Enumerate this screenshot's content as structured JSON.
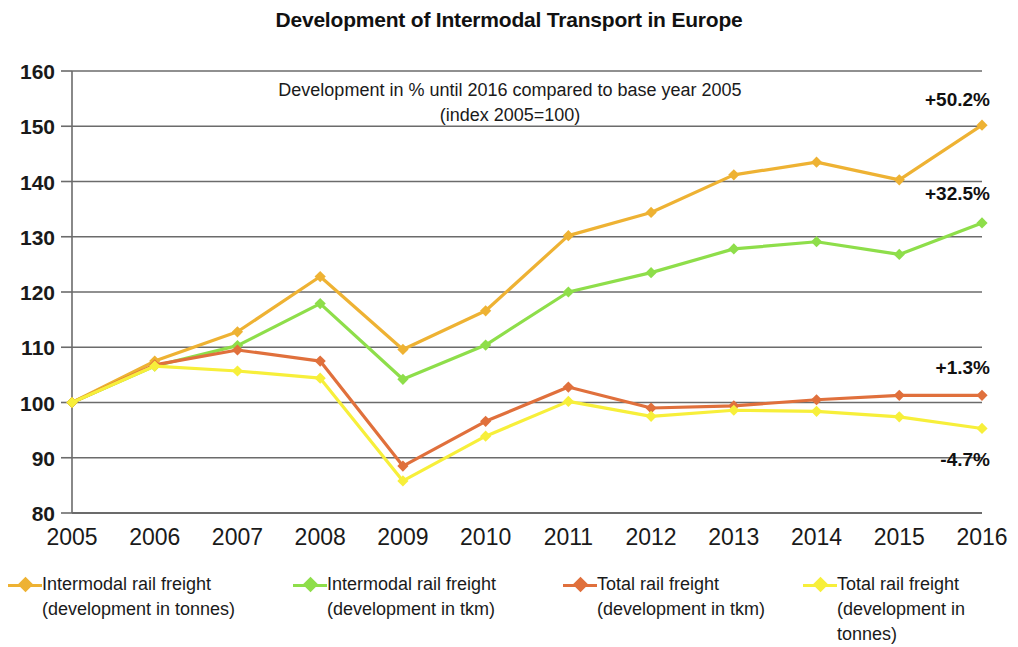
{
  "chart_data": {
    "type": "line",
    "title": "Development of Intermodal Transport in Europe",
    "subtitle_line1": "Development in % until 2016 compared  to base year 2005",
    "subtitle_line2": "(index 2005=100)",
    "xlabel": "",
    "ylabel": "",
    "x": [
      2005,
      2006,
      2007,
      2008,
      2009,
      2010,
      2011,
      2012,
      2013,
      2014,
      2015,
      2016
    ],
    "categories": [
      "2005",
      "2006",
      "2007",
      "2008",
      "2009",
      "2010",
      "2011",
      "2012",
      "2013",
      "2014",
      "2015",
      "2016"
    ],
    "ylim": [
      80,
      160
    ],
    "yticks": [
      80,
      90,
      100,
      110,
      120,
      130,
      140,
      150,
      160
    ],
    "grid": true,
    "legend_position": "bottom",
    "series": [
      {
        "name": "Intermodal rail freight\n(development in tonnes)",
        "color": "#eeb233",
        "values": [
          100.0,
          107.5,
          112.8,
          122.8,
          109.6,
          116.6,
          130.2,
          134.4,
          141.2,
          143.5,
          140.3,
          150.2
        ],
        "end_label": "+50.2%"
      },
      {
        "name": "Intermodal rail freight\n(development in tkm)",
        "color": "#8ede4a",
        "values": [
          100.0,
          106.6,
          110.3,
          117.9,
          104.2,
          110.4,
          120.0,
          123.5,
          127.8,
          129.1,
          126.8,
          132.5
        ],
        "end_label": "+32.5%"
      },
      {
        "name": "Total rail freight\n(development in tkm)",
        "color": "#e0703c",
        "values": [
          100.0,
          106.8,
          109.5,
          107.5,
          88.5,
          96.6,
          102.8,
          99.0,
          99.4,
          100.5,
          101.3,
          101.3
        ],
        "end_label": "+1.3%"
      },
      {
        "name": "Total rail freight\n(development in tonnes)",
        "color": "#f7ef3a",
        "values": [
          100.0,
          106.6,
          105.7,
          104.4,
          85.8,
          93.9,
          100.2,
          97.5,
          98.6,
          98.4,
          97.4,
          95.3
        ],
        "end_label": "-4.7%"
      }
    ],
    "annotations": [
      {
        "text": "+50.2%",
        "x": 2016,
        "y": 155.0
      },
      {
        "text": "+32.5%",
        "x": 2016,
        "y": 138.0
      },
      {
        "text": "+1.3%",
        "x": 2016,
        "y": 106.5
      },
      {
        "text": "-4.7%",
        "x": 2016,
        "y": 89.8
      }
    ]
  },
  "legend": {
    "items": [
      {
        "label": "Intermodal rail freight\n(development in tonnes)",
        "color": "#eeb233"
      },
      {
        "label": "Intermodal rail freight\n(development in tkm)",
        "color": "#8ede4a"
      },
      {
        "label": "Total rail freight\n(development in tkm)",
        "color": "#e0703c"
      },
      {
        "label": "Total rail freight\n(development in tonnes)",
        "color": "#f7ef3a"
      }
    ]
  }
}
